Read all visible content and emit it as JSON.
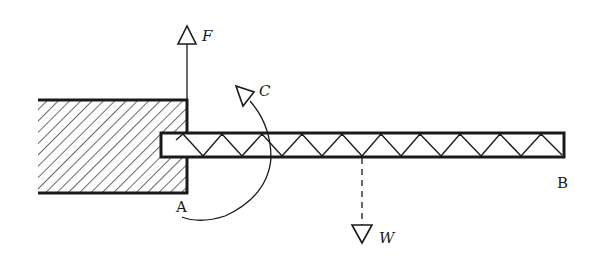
{
  "diagram": {
    "type": "cantilever-truss-free-body",
    "colors": {
      "ink": "#1a1a1a",
      "background": "#ffffff"
    },
    "wall": {
      "x": 38,
      "y": 100,
      "width": 149,
      "height": 93,
      "hatch": "diagonal"
    },
    "beam": {
      "x1": 161,
      "x2": 564,
      "y_top": 133,
      "y_bottom": 157,
      "pattern": "warren-truss"
    },
    "labels": {
      "force_f": "F",
      "couple_c": "C",
      "weight_w": "W",
      "point_a": "A",
      "point_b": "B"
    },
    "forces": [
      {
        "name": "F",
        "direction": "up",
        "x": 187,
        "from_y": 100,
        "to_y": 26
      },
      {
        "name": "W",
        "direction": "down",
        "x": 362,
        "from_y": 157,
        "to_y": 243,
        "line_style": "dashed"
      },
      {
        "name": "C",
        "type": "couple",
        "rotation": "counterclockwise"
      }
    ]
  }
}
